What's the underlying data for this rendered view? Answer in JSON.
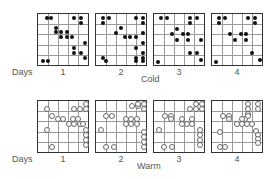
{
  "labels": {
    "days": "Days",
    "cold": "Cold",
    "warm": "Warm"
  },
  "day_numbers": [
    "1",
    "2",
    "3",
    "4"
  ],
  "grid": {
    "rows": 5,
    "cols": 5
  },
  "cold": {
    "marker": "filled-dot",
    "color": "#111111",
    "panels": [
      {
        "day": "1",
        "points": [
          [
            0.18,
            0.07
          ],
          [
            0.26,
            0.07
          ],
          [
            0.72,
            0.07
          ],
          [
            0.86,
            0.07
          ],
          [
            0.86,
            0.17
          ],
          [
            0.35,
            0.27
          ],
          [
            0.35,
            0.36
          ],
          [
            0.46,
            0.36
          ],
          [
            0.57,
            0.36
          ],
          [
            0.46,
            0.46
          ],
          [
            0.57,
            0.46
          ],
          [
            0.68,
            0.46
          ],
          [
            0.93,
            0.56
          ],
          [
            0.72,
            0.66
          ],
          [
            0.72,
            0.76
          ],
          [
            0.86,
            0.76
          ],
          [
            0.93,
            0.86
          ],
          [
            0.1,
            0.93
          ],
          [
            0.2,
            0.93
          ]
        ]
      },
      {
        "day": "2",
        "points": [
          [
            0.13,
            0.07
          ],
          [
            0.26,
            0.07
          ],
          [
            0.13,
            0.17
          ],
          [
            0.79,
            0.07
          ],
          [
            0.93,
            0.07
          ],
          [
            0.93,
            0.17
          ],
          [
            0.5,
            0.27
          ],
          [
            0.4,
            0.38
          ],
          [
            0.57,
            0.46
          ],
          [
            0.68,
            0.46
          ],
          [
            0.79,
            0.46
          ],
          [
            0.93,
            0.38
          ],
          [
            0.93,
            0.56
          ],
          [
            0.79,
            0.66
          ],
          [
            0.93,
            0.76
          ],
          [
            0.13,
            0.86
          ],
          [
            0.2,
            0.93
          ],
          [
            0.79,
            0.86
          ],
          [
            0.79,
            0.93
          ],
          [
            0.93,
            0.86
          ],
          [
            0.93,
            0.93
          ]
        ]
      },
      {
        "day": "3",
        "points": [
          [
            0.13,
            0.07
          ],
          [
            0.26,
            0.07
          ],
          [
            0.72,
            0.07
          ],
          [
            0.86,
            0.07
          ],
          [
            0.72,
            0.17
          ],
          [
            0.46,
            0.3
          ],
          [
            0.35,
            0.4
          ],
          [
            0.57,
            0.4
          ],
          [
            0.46,
            0.5
          ],
          [
            0.68,
            0.4
          ],
          [
            0.68,
            0.5
          ],
          [
            0.93,
            0.5
          ],
          [
            0.72,
            0.76
          ],
          [
            0.86,
            0.76
          ],
          [
            0.93,
            0.9
          ],
          [
            0.08,
            0.95
          ]
        ]
      },
      {
        "day": "4",
        "points": [
          [
            0.13,
            0.07
          ],
          [
            0.26,
            0.07
          ],
          [
            0.13,
            0.17
          ],
          [
            0.72,
            0.07
          ],
          [
            0.86,
            0.07
          ],
          [
            0.86,
            0.17
          ],
          [
            0.35,
            0.4
          ],
          [
            0.46,
            0.5
          ],
          [
            0.57,
            0.4
          ],
          [
            0.68,
            0.4
          ],
          [
            0.68,
            0.5
          ],
          [
            0.79,
            0.76
          ],
          [
            0.96,
            0.9
          ],
          [
            0.08,
            0.95
          ]
        ]
      }
    ]
  },
  "warm": {
    "marker": "open-circle",
    "color": "#666666",
    "panels": [
      {
        "day": "1",
        "points": [
          [
            0.95,
            0.06
          ],
          [
            0.72,
            0.15
          ],
          [
            0.83,
            0.15
          ],
          [
            0.95,
            0.15
          ],
          [
            0.17,
            0.15
          ],
          [
            0.28,
            0.29
          ],
          [
            0.39,
            0.36
          ],
          [
            0.5,
            0.36
          ],
          [
            0.7,
            0.36
          ],
          [
            0.79,
            0.36
          ],
          [
            0.61,
            0.45
          ],
          [
            0.72,
            0.45
          ],
          [
            0.83,
            0.45
          ],
          [
            0.9,
            0.45
          ],
          [
            0.17,
            0.56
          ],
          [
            0.95,
            0.56
          ],
          [
            0.95,
            0.66
          ],
          [
            0.95,
            0.76
          ],
          [
            0.95,
            0.86
          ],
          [
            0.28,
            0.9
          ]
        ]
      },
      {
        "day": "2",
        "points": [
          [
            0.72,
            0.1
          ],
          [
            0.83,
            0.1
          ],
          [
            0.95,
            0.06
          ],
          [
            0.95,
            0.15
          ],
          [
            0.83,
            0.06
          ],
          [
            0.2,
            0.29
          ],
          [
            0.31,
            0.29
          ],
          [
            0.59,
            0.36
          ],
          [
            0.7,
            0.36
          ],
          [
            0.81,
            0.36
          ],
          [
            0.59,
            0.45
          ],
          [
            0.7,
            0.45
          ],
          [
            0.81,
            0.45
          ],
          [
            0.1,
            0.56
          ],
          [
            0.95,
            0.6
          ],
          [
            0.95,
            0.7
          ],
          [
            0.95,
            0.8
          ],
          [
            0.95,
            0.9
          ],
          [
            0.2,
            0.9
          ],
          [
            0.35,
            0.9
          ]
        ]
      },
      {
        "day": "3",
        "points": [
          [
            0.83,
            0.06
          ],
          [
            0.95,
            0.06
          ],
          [
            0.72,
            0.15
          ],
          [
            0.83,
            0.15
          ],
          [
            0.95,
            0.15
          ],
          [
            0.22,
            0.29
          ],
          [
            0.33,
            0.29
          ],
          [
            0.33,
            0.36
          ],
          [
            0.55,
            0.36
          ],
          [
            0.76,
            0.36
          ],
          [
            0.55,
            0.45
          ],
          [
            0.66,
            0.45
          ],
          [
            0.76,
            0.45
          ],
          [
            0.1,
            0.56
          ],
          [
            0.92,
            0.56
          ],
          [
            0.92,
            0.66
          ],
          [
            0.92,
            0.76
          ],
          [
            0.92,
            0.86
          ],
          [
            0.2,
            0.9
          ],
          [
            0.35,
            0.9
          ]
        ]
      },
      {
        "day": "4",
        "points": [
          [
            0.72,
            0.06
          ],
          [
            0.92,
            0.06
          ],
          [
            0.72,
            0.15
          ],
          [
            0.92,
            0.15
          ],
          [
            0.72,
            0.25
          ],
          [
            0.22,
            0.29
          ],
          [
            0.33,
            0.29
          ],
          [
            0.33,
            0.36
          ],
          [
            0.66,
            0.36
          ],
          [
            0.72,
            0.29
          ],
          [
            0.6,
            0.36
          ],
          [
            0.5,
            0.45
          ],
          [
            0.6,
            0.45
          ],
          [
            0.7,
            0.45
          ],
          [
            0.8,
            0.45
          ],
          [
            0.15,
            0.6
          ],
          [
            0.88,
            0.58
          ],
          [
            0.92,
            0.66
          ],
          [
            0.92,
            0.74
          ],
          [
            0.92,
            0.82
          ],
          [
            0.15,
            0.9
          ],
          [
            0.26,
            0.9
          ]
        ]
      }
    ]
  }
}
